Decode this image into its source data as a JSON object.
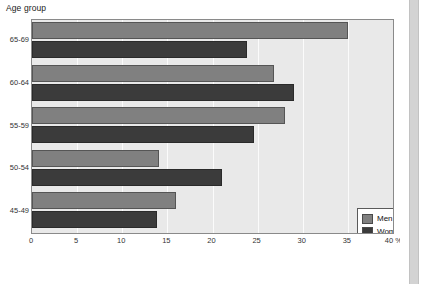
{
  "chart_data": {
    "type": "bar",
    "orientation": "horizontal",
    "title": "Age group",
    "xlabel": "%",
    "ylabel": "Age group",
    "categories": [
      "65-69",
      "60-64",
      "55-59",
      "50-54",
      "45-49"
    ],
    "series": [
      {
        "name": "Men",
        "color": "#808080",
        "values": [
          35.0,
          26.8,
          28.0,
          14.1,
          16.0
        ]
      },
      {
        "name": "Women",
        "color": "#3b3b3b",
        "values": [
          23.8,
          29.0,
          24.6,
          21.0,
          13.9
        ]
      }
    ],
    "xlim": [
      0,
      40
    ],
    "xticks": [
      0,
      5,
      10,
      15,
      20,
      25,
      30,
      35,
      40
    ],
    "xtick_labels": [
      "0",
      "5",
      "10",
      "15",
      "20",
      "25",
      "30",
      "35",
      "40 %"
    ],
    "grid": true,
    "grid_axis": "x",
    "legend_position": "lower-right",
    "plot_background": "#e9e9e9",
    "grid_color": "#fbfbfb"
  },
  "figure": {
    "axis_title": "Age group"
  },
  "legend": {
    "entries": [
      {
        "label": "Men"
      },
      {
        "label": "Women"
      }
    ]
  }
}
